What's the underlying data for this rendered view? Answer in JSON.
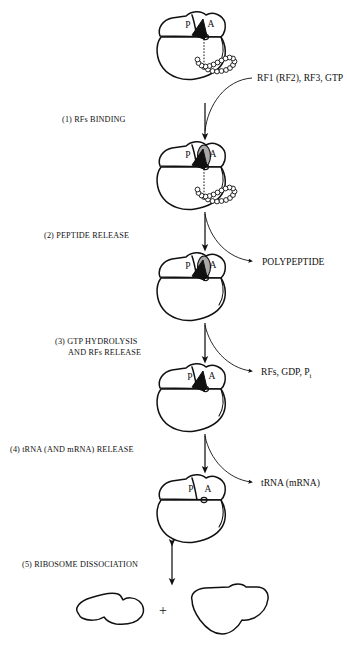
{
  "diagram": {
    "colors": {
      "ink": "#111111",
      "background": "#ffffff",
      "release_factor_gray": "#a8a8a8",
      "trna_black": "#111111"
    },
    "site_labels": {
      "p_site": "P",
      "a_site": "A"
    },
    "plus_sign": "+",
    "steps": [
      {
        "id": "step-1",
        "label": "(1) RFs BINDING"
      },
      {
        "id": "step-2",
        "label": "(2) PEPTIDE RELEASE"
      },
      {
        "id": "step-3",
        "label_line1": "(3) GTP HYDROLYSIS",
        "label_line2": "AND RFs RELEASE"
      },
      {
        "id": "step-4",
        "label": "(4) tRNA (AND mRNA) RELEASE"
      },
      {
        "id": "step-5",
        "label": "(5) RIBOSOME DISSOCIATION"
      }
    ],
    "reactants": [
      {
        "id": "reactant-rfs",
        "label": "RF1 (RF2), RF3, GTP"
      }
    ],
    "products": [
      {
        "id": "product-polypeptide",
        "label": "POLYPEPTIDE"
      },
      {
        "id": "product-rfs-gdp-pi",
        "label_main": "RFs, GDP, P",
        "label_sub": "i"
      },
      {
        "id": "product-trna-mrna",
        "label": "tRNA (mRNA)"
      }
    ],
    "subunits": [
      {
        "id": "small-subunit",
        "name": "small ribosomal subunit"
      },
      {
        "id": "large-subunit",
        "name": "large ribosomal subunit"
      }
    ]
  }
}
